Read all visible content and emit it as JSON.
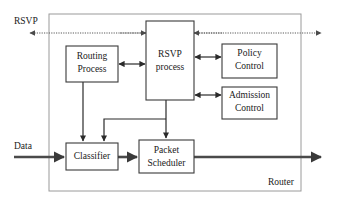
{
  "diagram": {
    "container": {
      "label": "Router",
      "label_x": 284,
      "label_y": 183
    },
    "external_labels": [
      {
        "id": "rsvp-label",
        "text": "RSVP",
        "x": 14,
        "y": 22
      },
      {
        "id": "data-label",
        "text": "Data",
        "x": 14,
        "y": 147
      }
    ],
    "nodes": [
      {
        "id": "routing-process",
        "lines": [
          "Routing",
          "Process"
        ],
        "x": 66,
        "y": 46,
        "w": 52,
        "h": 36
      },
      {
        "id": "rsvp-process",
        "lines": [
          "RSVP",
          "process"
        ],
        "x": 146,
        "y": 21,
        "w": 48,
        "h": 79
      },
      {
        "id": "policy-control",
        "lines": [
          "Policy",
          "Control"
        ],
        "x": 222,
        "y": 44,
        "w": 55,
        "h": 34
      },
      {
        "id": "admission-control",
        "lines": [
          "Admission",
          "Control"
        ],
        "x": 222,
        "y": 87,
        "w": 55,
        "h": 32
      },
      {
        "id": "classifier",
        "lines": [
          "Classifier"
        ],
        "x": 66,
        "y": 143,
        "w": 52,
        "h": 27
      },
      {
        "id": "packet-scheduler",
        "lines": [
          "Packet",
          "Scheduler"
        ],
        "x": 139,
        "y": 140,
        "w": 55,
        "h": 33
      }
    ],
    "connections": [
      {
        "id": "rsvp-in-left",
        "kind": "dotted",
        "from": "external-left",
        "to": "rsvp-process"
      },
      {
        "id": "rsvp-in-right",
        "kind": "dotted",
        "from": "external-right",
        "to": "rsvp-process"
      },
      {
        "id": "routing-rsvp",
        "kind": "solid-bidirectional",
        "from": "routing-process",
        "to": "rsvp-process"
      },
      {
        "id": "rsvp-policy",
        "kind": "solid-bidirectional",
        "from": "rsvp-process",
        "to": "policy-control"
      },
      {
        "id": "rsvp-admission",
        "kind": "solid-bidirectional",
        "from": "rsvp-process",
        "to": "admission-control"
      },
      {
        "id": "routing-classifier",
        "kind": "solid",
        "from": "routing-process",
        "to": "classifier"
      },
      {
        "id": "rsvp-classifier",
        "kind": "solid",
        "from": "rsvp-process",
        "to": "classifier"
      },
      {
        "id": "rsvp-scheduler",
        "kind": "solid",
        "from": "rsvp-process",
        "to": "packet-scheduler"
      },
      {
        "id": "data-in",
        "kind": "thick",
        "from": "external-left",
        "to": "classifier"
      },
      {
        "id": "classifier-scheduler",
        "kind": "thick",
        "from": "classifier",
        "to": "packet-scheduler"
      },
      {
        "id": "data-out",
        "kind": "thick",
        "from": "packet-scheduler",
        "to": "external-right"
      }
    ]
  },
  "colors": {
    "node_stroke": "#3a3a3a",
    "container_stroke": "#9a9a9a",
    "solid_link": "#2b2b2b",
    "thick_link": "#4a4a4a",
    "dotted_link": "#5a5a5a",
    "text": "#1a1a1a",
    "background": "#ffffff"
  }
}
